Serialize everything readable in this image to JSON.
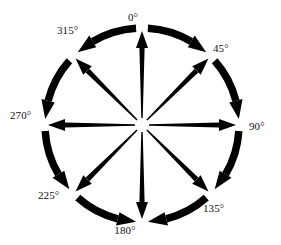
{
  "figure": {
    "type": "compass-rose-rotation-diagram",
    "title": "",
    "background_color": "#ffffff",
    "stroke_color": "#000000",
    "label_color": "#111111",
    "center": {
      "x": 142,
      "y": 125
    },
    "radius": 97,
    "degree_symbol": "°"
  },
  "chart_data": {
    "type": "scatter",
    "title": "",
    "xlabel": "",
    "ylabel": "",
    "grid": false,
    "legend": null,
    "categories": [
      "0°",
      "45°",
      "90°",
      "135°",
      "180°",
      "225°",
      "270°",
      "315°"
    ],
    "values": [
      0,
      45,
      90,
      135,
      180,
      225,
      270,
      315
    ],
    "units": "degrees",
    "increment": 45,
    "count": 8
  },
  "labels": [
    {
      "text": "0°",
      "value": 0,
      "left": 133,
      "top": 12,
      "align": "center"
    },
    {
      "text": "45°",
      "value": 45,
      "left": 213,
      "top": 43,
      "align": "left"
    },
    {
      "text": "90°",
      "value": 90,
      "left": 249,
      "top": 121,
      "align": "left"
    },
    {
      "text": "135°",
      "value": 135,
      "left": 203,
      "top": 203,
      "align": "left"
    },
    {
      "text": "180°",
      "value": 180,
      "left": 125,
      "top": 225,
      "align": "center"
    },
    {
      "text": "225°",
      "value": 225,
      "left": 38,
      "top": 190,
      "align": "left"
    },
    {
      "text": "270°",
      "value": 270,
      "left": 10,
      "top": 110,
      "align": "left"
    },
    {
      "text": "315°",
      "value": 315,
      "left": 57,
      "top": 25,
      "align": "left"
    }
  ],
  "spokes": [
    {
      "name": "spoke-0",
      "angle": 0,
      "direction": "outward"
    },
    {
      "name": "spoke-45",
      "angle": 45,
      "direction": "outward"
    },
    {
      "name": "spoke-90",
      "angle": 90,
      "direction": "outward"
    },
    {
      "name": "spoke-135",
      "angle": 135,
      "direction": "outward"
    },
    {
      "name": "spoke-180",
      "angle": 180,
      "direction": "outward"
    },
    {
      "name": "spoke-225",
      "angle": 225,
      "direction": "outward"
    },
    {
      "name": "spoke-270",
      "angle": 270,
      "direction": "outward"
    },
    {
      "name": "spoke-315",
      "angle": 315,
      "direction": "outward"
    }
  ],
  "arcs": [
    {
      "name": "arc-0-45",
      "from": 0,
      "to": 45,
      "sweep": "clockwise",
      "arrowhead_at": 45
    },
    {
      "name": "arc-45-90",
      "from": 45,
      "to": 90,
      "sweep": "clockwise",
      "arrowhead_at": 90
    },
    {
      "name": "arc-90-135",
      "from": 90,
      "to": 135,
      "sweep": "clockwise",
      "arrowhead_at": 135
    },
    {
      "name": "arc-135-180",
      "from": 135,
      "to": 180,
      "sweep": "clockwise",
      "arrowhead_at": 180
    },
    {
      "name": "arc-225-180",
      "from": 180,
      "to": 225,
      "sweep": "counterclockwise",
      "arrowhead_at": 225
    },
    {
      "name": "arc-270-225",
      "from": 225,
      "to": 270,
      "sweep": "counterclockwise",
      "arrowhead_at": 270
    },
    {
      "name": "arc-315-270",
      "from": 270,
      "to": 315,
      "sweep": "counterclockwise",
      "arrowhead_at": 315
    },
    {
      "name": "arc-0-315",
      "from": 315,
      "to": 360,
      "sweep": "counterclockwise",
      "arrowhead_at": 360
    }
  ]
}
